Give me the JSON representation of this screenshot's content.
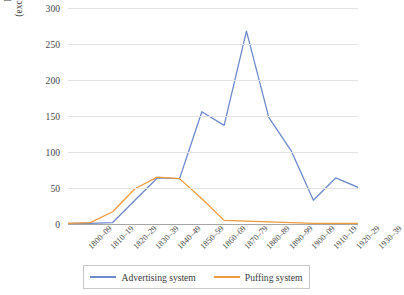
{
  "chart_data": {
    "type": "line",
    "title": "",
    "xlabel": "",
    "ylabel": "Press publications (excluding advertisments)",
    "ylabel_lines": [
      "Press publications",
      "(excluding advertisments)"
    ],
    "ylim": [
      0,
      300
    ],
    "yticks": [
      0,
      50,
      100,
      150,
      200,
      250,
      300
    ],
    "grid": true,
    "legend_position": "bottom",
    "categories": [
      "1800–09",
      "1810–19",
      "1820–29",
      "1830–39",
      "1840–49",
      "1850–59",
      "1860–69",
      "1870–79",
      "1880–89",
      "1890–99",
      "1900–09",
      "1910–19",
      "1920–29",
      "1930–39"
    ],
    "series": [
      {
        "name": "Advertising system",
        "color": "#6E8ACB",
        "values": [
          1,
          1,
          2,
          33,
          64,
          63,
          156,
          137,
          268,
          148,
          102,
          33,
          64,
          51
        ]
      },
      {
        "name": "Puffing system",
        "color": "#ED9B3C",
        "values": [
          1,
          2,
          17,
          49,
          65,
          63,
          35,
          5,
          4,
          3,
          2,
          1,
          1,
          1
        ]
      }
    ]
  },
  "legend": {
    "entries": [
      {
        "label": "Advertising system",
        "color": "#6E8ACB"
      },
      {
        "label": "Puffing system",
        "color": "#ED9B3C"
      }
    ]
  },
  "colors": {
    "advertising": "#6E8ACB",
    "puffing": "#ED9B3C",
    "gridline": "#E2E2E2",
    "axis": "#A6A6A6",
    "text": "#3C3C3C",
    "background": "#FFFFFF"
  }
}
